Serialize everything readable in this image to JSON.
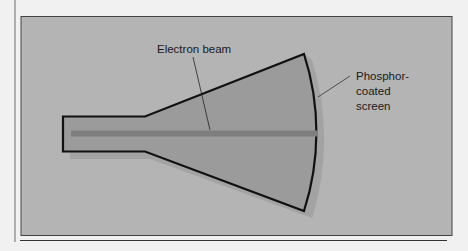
{
  "figure": {
    "labels": {
      "electron_beam": "Electron beam",
      "screen_line1": "Phosphor-",
      "screen_line2": "coated",
      "screen_line3": "screen"
    },
    "colors": {
      "page_bg": "#f1f1f1",
      "panel_bg": "#b4b4b4",
      "tube_fill": "#9b9b9b",
      "shadow": "#a3a3a3",
      "beam": "#7e7e7e",
      "outline": "#111111"
    }
  }
}
